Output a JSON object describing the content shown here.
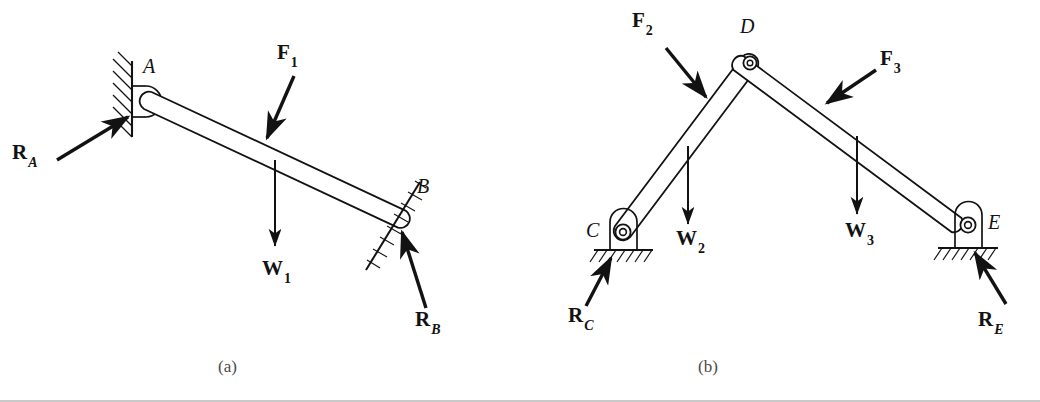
{
  "figure": {
    "background_color": "#ffffff",
    "ink_color": "#121212",
    "caption_color": "#4a4a4a",
    "panels": [
      {
        "id": "a",
        "caption": "(a)",
        "caption_x": 218,
        "caption_y": 360
      },
      {
        "id": "b",
        "caption": "(b)",
        "caption_x": 698,
        "caption_y": 360
      }
    ]
  },
  "panel_a": {
    "description_labels": {
      "point_A": "A",
      "point_B": "B"
    },
    "force_labels": [
      {
        "name": "R_A",
        "base": "R",
        "sub": "A",
        "sub_italic": true,
        "x": 12,
        "y": 145
      },
      {
        "name": "F_1",
        "base": "F",
        "sub": "1",
        "sub_italic": false,
        "x": 277,
        "y": 44
      },
      {
        "name": "W_1",
        "base": "W",
        "sub": "1",
        "sub_italic": false,
        "x": 262,
        "y": 262
      },
      {
        "name": "R_B",
        "base": "R",
        "sub": "B",
        "sub_italic": true,
        "x": 415,
        "y": 312
      }
    ],
    "point_labels": [
      {
        "name": "A",
        "text": "A",
        "x": 143,
        "y": 58
      },
      {
        "name": "B",
        "text": "B",
        "x": 417,
        "y": 178
      }
    ]
  },
  "panel_b": {
    "force_labels": [
      {
        "name": "F_2",
        "base": "F",
        "sub": "2",
        "sub_italic": false,
        "x": 632,
        "y": 12
      },
      {
        "name": "F_3",
        "base": "F",
        "sub": "3",
        "sub_italic": false,
        "x": 880,
        "y": 50
      },
      {
        "name": "W_2",
        "base": "W",
        "sub": "2",
        "sub_italic": false,
        "x": 676,
        "y": 232
      },
      {
        "name": "W_3",
        "base": "W",
        "sub": "3",
        "sub_italic": false,
        "x": 845,
        "y": 224
      },
      {
        "name": "R_C",
        "base": "R",
        "sub": "C",
        "sub_italic": true,
        "x": 568,
        "y": 308
      },
      {
        "name": "R_E",
        "base": "R",
        "sub": "E",
        "sub_italic": true,
        "x": 978,
        "y": 312
      }
    ],
    "point_labels": [
      {
        "name": "C",
        "text": "C",
        "x": 588,
        "y": 222
      },
      {
        "name": "D",
        "text": "D",
        "x": 740,
        "y": 18
      },
      {
        "name": "E",
        "text": "E",
        "x": 988,
        "y": 214
      }
    ]
  },
  "geometry": {
    "panel_a": {
      "wall_x": 132,
      "wall_top": 62,
      "wall_bottom": 136,
      "pin_A": [
        148,
        100
      ],
      "bar_end_B": [
        402,
        219
      ],
      "incline_B_top": [
        418,
        185
      ],
      "incline_B_bottom": [
        368,
        266
      ]
    },
    "panel_b": {
      "pin_C": [
        623,
        232
      ],
      "pin_D": [
        750,
        63
      ],
      "pin_E": [
        968,
        225
      ],
      "ground_C_y": 250,
      "ground_E_y": 248
    }
  }
}
